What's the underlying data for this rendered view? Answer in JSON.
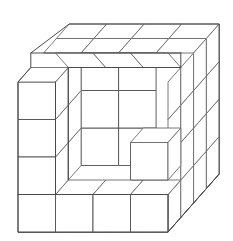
{
  "figure": {
    "kind": "isometric-block-diagram",
    "canvas": {
      "width": 233,
      "height": 241,
      "background": "#ffffff"
    },
    "style": {
      "line_color": "#5f5f5f",
      "line_color_front": "#4f4f4f",
      "line_width": 0.9,
      "face_fill": "#ffffff"
    },
    "projection": {
      "type": "oblique-isometric",
      "unit_square_px": 37.5,
      "depth_dx_px": 12.8,
      "depth_dy_px": -14.5,
      "grid_divisions": 4,
      "origin_front_bottom_left": {
        "x": 18,
        "y": 232
      }
    },
    "counts": {
      "grid_columns": 4,
      "grid_rows": 4,
      "grid_layers": 4,
      "top_face_cells_visible": 8,
      "right_face_cells_visible": 16,
      "front_bottom_row_cells": 4,
      "left_wall_cells": 4,
      "protruding_step_cubes": 1
    }
  },
  "labels": {
    "none_visible": ""
  }
}
